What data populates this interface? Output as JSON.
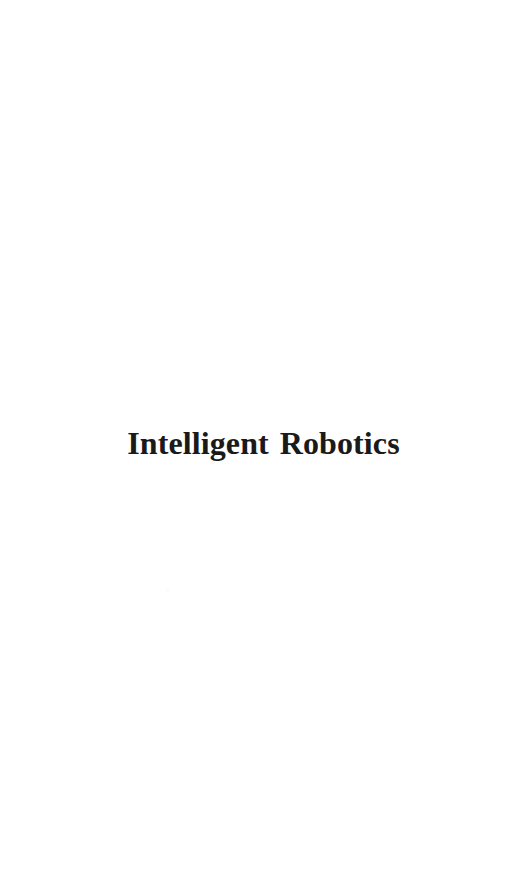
{
  "page": {
    "kind": "half-title-page",
    "background_color": "#ffffff",
    "width": 527,
    "height": 869
  },
  "halftitle": {
    "full_text": "Intelligent Robotics",
    "word_one": "Intelligent",
    "word_two": "Robotics",
    "ink_color": "#1a1a1a"
  },
  "artifacts": {
    "scan_speck_color": "#fbfbfb"
  }
}
